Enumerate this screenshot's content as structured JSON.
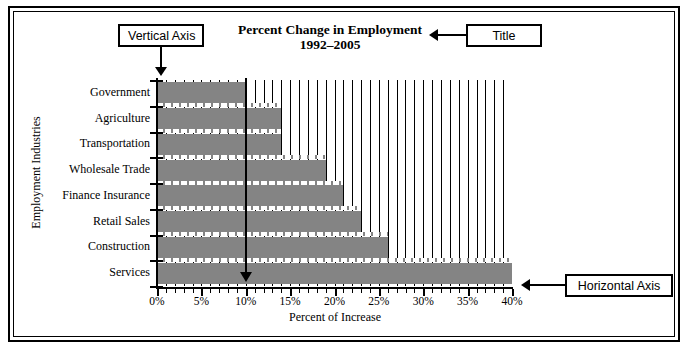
{
  "chart_data": {
    "type": "bar",
    "orientation": "horizontal",
    "title": "Percent Change in Employment",
    "subtitle": "1992–2005",
    "xlabel": "Percent of Increase",
    "ylabel": "Employment Industries",
    "categories": [
      "Government",
      "Agriculture",
      "Transportation",
      "Wholesale Trade",
      "Finance Insurance",
      "Retail Sales",
      "Construction",
      "Services"
    ],
    "values": [
      10,
      14,
      14,
      19,
      21,
      23,
      26,
      40
    ],
    "xlim": [
      0,
      40
    ],
    "xticks": [
      0,
      5,
      10,
      15,
      20,
      25,
      30,
      35,
      40
    ],
    "xtick_labels": [
      "0%",
      "5%",
      "10%",
      "15%",
      "20%",
      "25%",
      "30%",
      "35%",
      "40%"
    ],
    "minor_tick_step": 1,
    "grid": true,
    "grid_axis": "x",
    "legend": "none",
    "bar_color": "#848484",
    "axis_color": "#000000",
    "background": "#ffffff"
  },
  "annotations": {
    "vertical_axis": {
      "label": "Vertical Axis",
      "points_to": "y-axis"
    },
    "title": {
      "label": "Title",
      "points_to": "chart-title"
    },
    "horizontal_axis": {
      "label": "Horizontal Axis",
      "points_to": "x-axis"
    }
  }
}
